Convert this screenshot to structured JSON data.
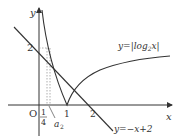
{
  "diagram": {
    "title": "",
    "axes": {
      "x_label": "x",
      "y_label": "y",
      "origin_label": "O"
    },
    "x_ticks": [
      {
        "value": 0.25,
        "label_num": "1",
        "label_den": "4"
      },
      {
        "value": 1,
        "label": "1"
      },
      {
        "value": 2,
        "label": "2"
      }
    ],
    "y_ticks": [
      {
        "value": 2,
        "label": "2"
      }
    ],
    "curves": [
      {
        "name": "log-abs-curve",
        "label": "y=|log₂x|",
        "equation": "y = |log2(x)|"
      },
      {
        "name": "line",
        "label": "y=−x+2",
        "equation": "y = -x + 2"
      }
    ],
    "annotations": [
      {
        "name": "a2-label",
        "text": "a₂",
        "note": "label visible in figure; approximate position x≈0.3 (estimate, not labeled on axis)"
      }
    ],
    "estimated_points": {
      "note": "computed from the equations, not read from the figure",
      "right_intersection_approx": [
        1.5,
        0.5
      ]
    },
    "labels": {
      "y_axis": "y",
      "x_axis": "x",
      "origin": "O",
      "tick_quarter_num": "1",
      "tick_quarter_den": "4",
      "tick_one": "1",
      "tick_two": "2",
      "y_two": "2",
      "a2": "a",
      "a2_sub": "2",
      "log_label_prefix": "y=|log",
      "log_label_sub": "2",
      "log_label_suffix": "x|",
      "line_label": "y=−x+2"
    },
    "colors": {
      "stroke": "#333333",
      "text": "#333333",
      "dotted": "#9a9a9a",
      "background": "#ffffff"
    }
  }
}
